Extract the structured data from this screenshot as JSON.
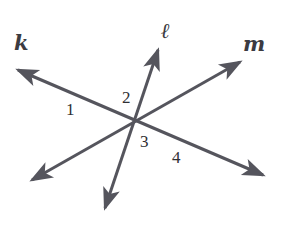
{
  "figure": {
    "kind": "geometry-diagram",
    "width": 281,
    "height": 227,
    "background_color": "#ffffff",
    "stroke_color": "#55555d",
    "label_color": "#3b3b41",
    "number_color": "#2f2f33",
    "stroke_width": 3
  },
  "lines": [
    {
      "id": "line-k",
      "label": "k",
      "label_x": 14,
      "label_y": 32,
      "from_x": 18,
      "from_y": 70,
      "to_x": 263,
      "to_y": 175,
      "arrow_start": true,
      "arrow_end": true
    },
    {
      "id": "line-l",
      "label": "ℓ",
      "label_x": 161,
      "label_y": 20,
      "from_x": 105,
      "from_y": 208,
      "to_x": 158,
      "to_y": 50,
      "arrow_start": true,
      "arrow_end": true
    },
    {
      "id": "line-m",
      "label": "m",
      "label_x": 243,
      "label_y": 33,
      "from_x": 32,
      "from_y": 180,
      "to_x": 240,
      "to_y": 62,
      "arrow_start": true,
      "arrow_end": true
    }
  ],
  "intersections": [
    {
      "id": "intersection-k-l",
      "x": 102,
      "y": 107
    },
    {
      "id": "intersection-k-m",
      "x": 172,
      "y": 138
    }
  ],
  "angle_labels": [
    {
      "id": "angle-1",
      "text": "1",
      "x": 66,
      "y": 101
    },
    {
      "id": "angle-2",
      "text": "2",
      "x": 122,
      "y": 89
    },
    {
      "id": "angle-3",
      "text": "3",
      "x": 140,
      "y": 133
    },
    {
      "id": "angle-4",
      "text": "4",
      "x": 172,
      "y": 149
    }
  ]
}
